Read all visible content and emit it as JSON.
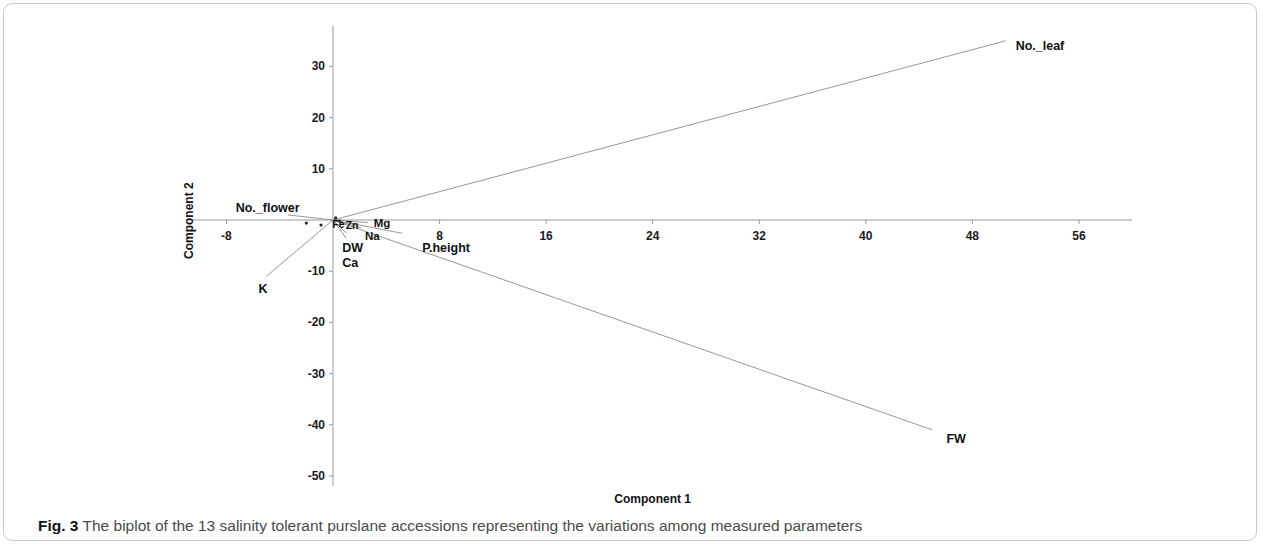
{
  "figure": {
    "caption_label": "Fig. 3",
    "caption_text": "The biplot of the 13 salinity tolerant purslane accessions representing the variations among measured parameters"
  },
  "chart_data": {
    "type": "scatter",
    "title": "",
    "subtitle": "",
    "xlabel": "Component 1",
    "ylabel": "Component 2",
    "xlim": [
      -11,
      60
    ],
    "ylim": [
      -52,
      38
    ],
    "xticks": [
      -8,
      8,
      16,
      24,
      32,
      40,
      48,
      56
    ],
    "yticks": [
      30,
      20,
      10,
      -10,
      -20,
      -30,
      -40,
      -50
    ],
    "xtick_labels": [
      "-8",
      "8",
      "16",
      "24",
      "32",
      "40",
      "48",
      "56"
    ],
    "ytick_labels": [
      "30",
      "20",
      "10",
      "-10",
      "-20",
      "-30",
      "-40",
      "-50"
    ],
    "grid": false,
    "legend": "none",
    "axis_style": "crosshair-through-origin",
    "origin": [
      0,
      0
    ],
    "vectors": [
      {
        "name": "No._leaf",
        "x": 50.5,
        "y": 35.0,
        "label": "No._leaf",
        "label_dx": 10,
        "label_dy": 6
      },
      {
        "name": "FW",
        "x": 45.0,
        "y": -41.0,
        "label": "FW",
        "label_dx": 14,
        "label_dy": 10
      },
      {
        "name": "K",
        "x": -5.0,
        "y": -11.0,
        "label": "K",
        "label_dx": -8,
        "label_dy": 14
      },
      {
        "name": "No._flower",
        "x": -3.4,
        "y": 1.0,
        "label": "No._flower",
        "label_dx": -52,
        "label_dy": -6
      },
      {
        "name": "Mg",
        "x": 2.6,
        "y": -0.5,
        "label": "Mg",
        "label_dx": 6,
        "label_dy": 2
      },
      {
        "name": "Na",
        "x": 2.1,
        "y": -1.5,
        "label": "Na",
        "label_dx": 4,
        "label_dy": 10
      },
      {
        "name": "DW",
        "x": 1.0,
        "y": -2.6,
        "label": "DW",
        "label_dx": -4,
        "label_dy": 16
      },
      {
        "name": "Ca",
        "x": 1.0,
        "y": -3.6,
        "label": "Ca",
        "label_dx": -4,
        "label_dy": 26
      },
      {
        "name": "P.height",
        "x": 5.2,
        "y": -2.6,
        "label": "P.height",
        "label_dx": 20,
        "label_dy": 16
      },
      {
        "name": "Fe",
        "x": 0.4,
        "y": -0.4,
        "label": "Fe",
        "label_dx": -6,
        "label_dy": 4
      },
      {
        "name": "Zn",
        "x": 0.8,
        "y": -0.6,
        "label": "Zn",
        "label_dx": 2,
        "label_dy": 4
      }
    ],
    "score_points": [
      {
        "x": -2.0,
        "y": -0.6
      },
      {
        "x": -0.9,
        "y": -1.0
      },
      {
        "x": 0.2,
        "y": 0.4
      },
      {
        "x": 0.5,
        "y": -0.2
      }
    ]
  }
}
